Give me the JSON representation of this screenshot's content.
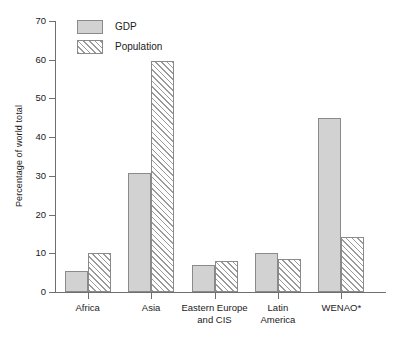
{
  "chart_data": {
    "type": "bar",
    "title": "",
    "subtitle": "",
    "xlabel": "",
    "ylabel": "Percentage of world total",
    "ylim": [
      0,
      70
    ],
    "yticks": [
      0,
      10,
      20,
      30,
      40,
      50,
      60,
      70
    ],
    "ytick_labels": [
      "0",
      "10",
      "20",
      "30",
      "40",
      "50",
      "60",
      "70"
    ],
    "grid": false,
    "legend_position": "top-left",
    "categories": [
      "Africa",
      "Asia",
      "Eastern Europe\nand CIS",
      "Latin\nAmerica",
      "WENAO*"
    ],
    "series": [
      {
        "name": "GDP",
        "color": "#d2d2d2",
        "pattern": "solid",
        "values": [
          5.3,
          30.8,
          7.0,
          10.2,
          45.0
        ]
      },
      {
        "name": "Population",
        "color": "#ffffff",
        "pattern": "diagonal-hatch",
        "values": [
          10.2,
          59.7,
          8.0,
          8.6,
          14.3
        ]
      }
    ],
    "annotations": []
  },
  "legend": {
    "items": [
      {
        "label": "GDP",
        "swatch": "gdp-swatch"
      },
      {
        "label": "Population",
        "swatch": "population-swatch"
      }
    ]
  },
  "axes": {
    "y_title": "Percentage of world total"
  }
}
